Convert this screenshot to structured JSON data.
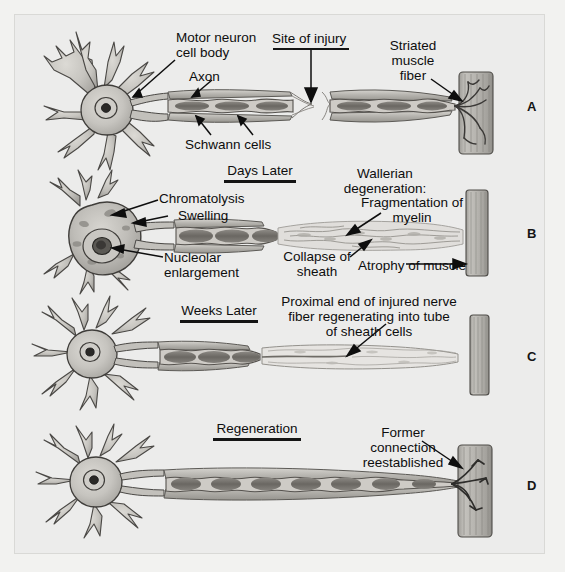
{
  "figure": {
    "background_color": "#ececeb",
    "frame_color": "#d9d9d6"
  },
  "panels": [
    {
      "letter": "A",
      "stage_label": "",
      "caption": "Normal motor neuron with axon, Schwann cells and striated muscle fiber; site of injury indicated"
    },
    {
      "letter": "B",
      "stage_label": "Days Later",
      "caption": "Chromatolysis, swelling, nucleolar enlargement, Wallerian degeneration distal to injury"
    },
    {
      "letter": "C",
      "stage_label": "Weeks Later",
      "caption": "Proximal end of injured nerve fiber regenerating into tube of sheath cells"
    },
    {
      "letter": "D",
      "stage_label": "Regeneration",
      "caption": "Former connection reestablished with muscle fiber"
    }
  ],
  "stage_titles": [
    {
      "text": "Days Later"
    },
    {
      "text": "Weeks Later"
    },
    {
      "text": "Regeneration"
    }
  ],
  "labels": {
    "motor_neuron_cell_body": "Motor neuron\ncell body",
    "axon": "Axon",
    "schwann_cells": "Schwann cells",
    "site_of_injury": "Site of injury",
    "striated_muscle_fiber": "Striated\nmuscle\nfiber",
    "chromatolysis": "Chromatolysis",
    "swelling": "Swelling",
    "nucleolar_enlargement": "Nucleolar\nenlargement",
    "wallerian_degeneration": "Wallerian\ndegeneration:",
    "fragmentation_of_myelin": "Fragmentation of\nmyelin",
    "collapse_of_sheath": "Collapse of\nsheath",
    "atrophy_of_muscle": "Atrophy of muscle",
    "proximal_end": "Proximal end of injured nerve\nfiber regenerating into tube\nof sheath cells",
    "former_connection": "Former\nconnection\nreestablished"
  },
  "colors": {
    "ink": "#0e0e0e",
    "paper": "#ececeb",
    "cell_fill": "#c9c7c2",
    "cell_shade": "#a8a6a1",
    "axon_core": "#6e6b66",
    "muscle_fill": "#b8b6b1",
    "muscle_stripe": "#8a8883"
  }
}
